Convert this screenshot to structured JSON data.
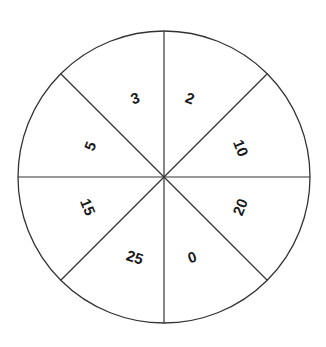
{
  "wheel": {
    "center": [
      164,
      177
    ],
    "radius": 146,
    "stroke_color": "#333333",
    "fill_color": "#ffffff",
    "segment_count": 8,
    "segments": [
      {
        "value": "2",
        "pos": [
          190,
          98
        ],
        "rotate": 20
      },
      {
        "value": "10",
        "pos": [
          241,
          148
        ],
        "rotate": 68
      },
      {
        "value": "20",
        "pos": [
          240,
          207
        ],
        "rotate": -68
      },
      {
        "value": "0",
        "pos": [
          192,
          257
        ],
        "rotate": -18
      },
      {
        "value": "25",
        "pos": [
          135,
          257
        ],
        "rotate": 18
      },
      {
        "value": "15",
        "pos": [
          88,
          207
        ],
        "rotate": 68
      },
      {
        "value": "5",
        "pos": [
          90,
          146
        ],
        "rotate": -68
      },
      {
        "value": "3",
        "pos": [
          135,
          98
        ],
        "rotate": -18
      }
    ]
  }
}
